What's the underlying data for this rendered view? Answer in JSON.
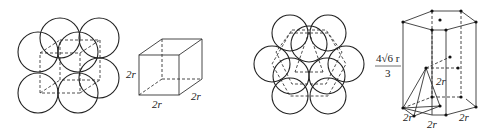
{
  "figures": [
    {
      "id": "simple-cubic-packing",
      "description": "Eight spheres in simple cubic packing with dashed unit cell"
    },
    {
      "id": "simple-cubic-cell",
      "labels": {
        "height": "2r",
        "width": "2r",
        "depth": "2r"
      }
    },
    {
      "id": "hexagonal-close-packing",
      "description": "Spheres in hexagonal close packing with dashed hexagonal cell"
    },
    {
      "id": "hexagonal-prism-cell",
      "labels": {
        "height_num": "4√6 r",
        "height_den": "3",
        "tetra_edge": "2r",
        "base_left": "2r",
        "base_mid": "2r",
        "base_right": "2r"
      }
    }
  ]
}
